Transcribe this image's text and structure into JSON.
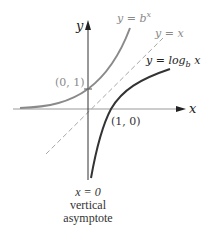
{
  "diagram": {
    "axes": {
      "x_label": "x",
      "y_label": "y"
    },
    "curves": [
      {
        "name": "exponential",
        "label": "y = b",
        "label_sup": "x",
        "color": "#8a8a8a"
      },
      {
        "name": "identity",
        "label": "y = x",
        "color": "#a0a0a0",
        "style": "dashed"
      },
      {
        "name": "logarithm",
        "label": "y = log",
        "label_sub": "b",
        "label_tail": " x",
        "color": "#333333"
      }
    ],
    "points": [
      {
        "label": "(0, 1)",
        "x": 0,
        "y": 1
      },
      {
        "label": "(1, 0)",
        "x": 1,
        "y": 0
      }
    ],
    "asymptote": {
      "equation": "x = 0",
      "line1": "vertical",
      "line2": "asymptote"
    }
  }
}
